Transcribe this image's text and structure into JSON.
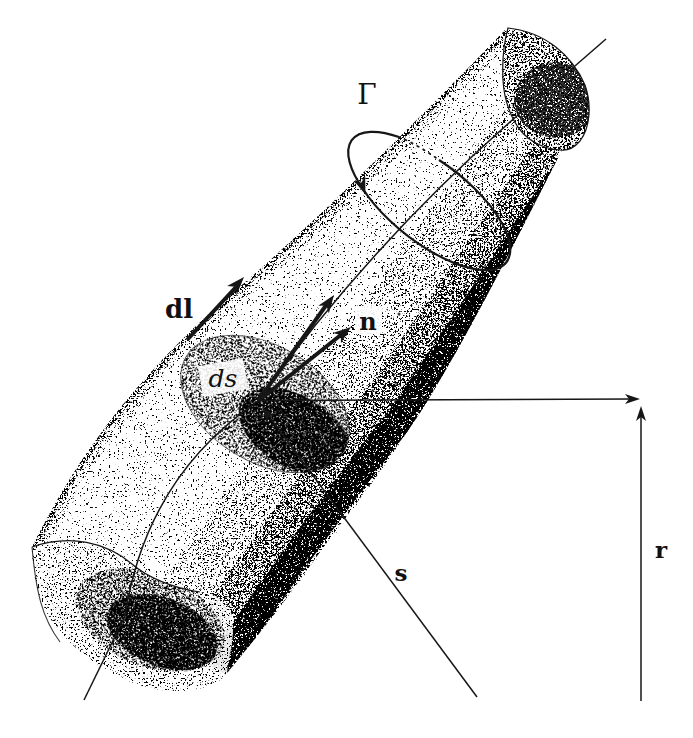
{
  "figure": {
    "colors": {
      "background": "#ffffff",
      "ink": "#161616",
      "shading": "stippled-grays"
    },
    "labels": {
      "circulation": "Γ",
      "line_element": "dl",
      "area_element": "ds",
      "normal_vector": "n",
      "s_vector": "s",
      "r_vector": "r"
    }
  }
}
